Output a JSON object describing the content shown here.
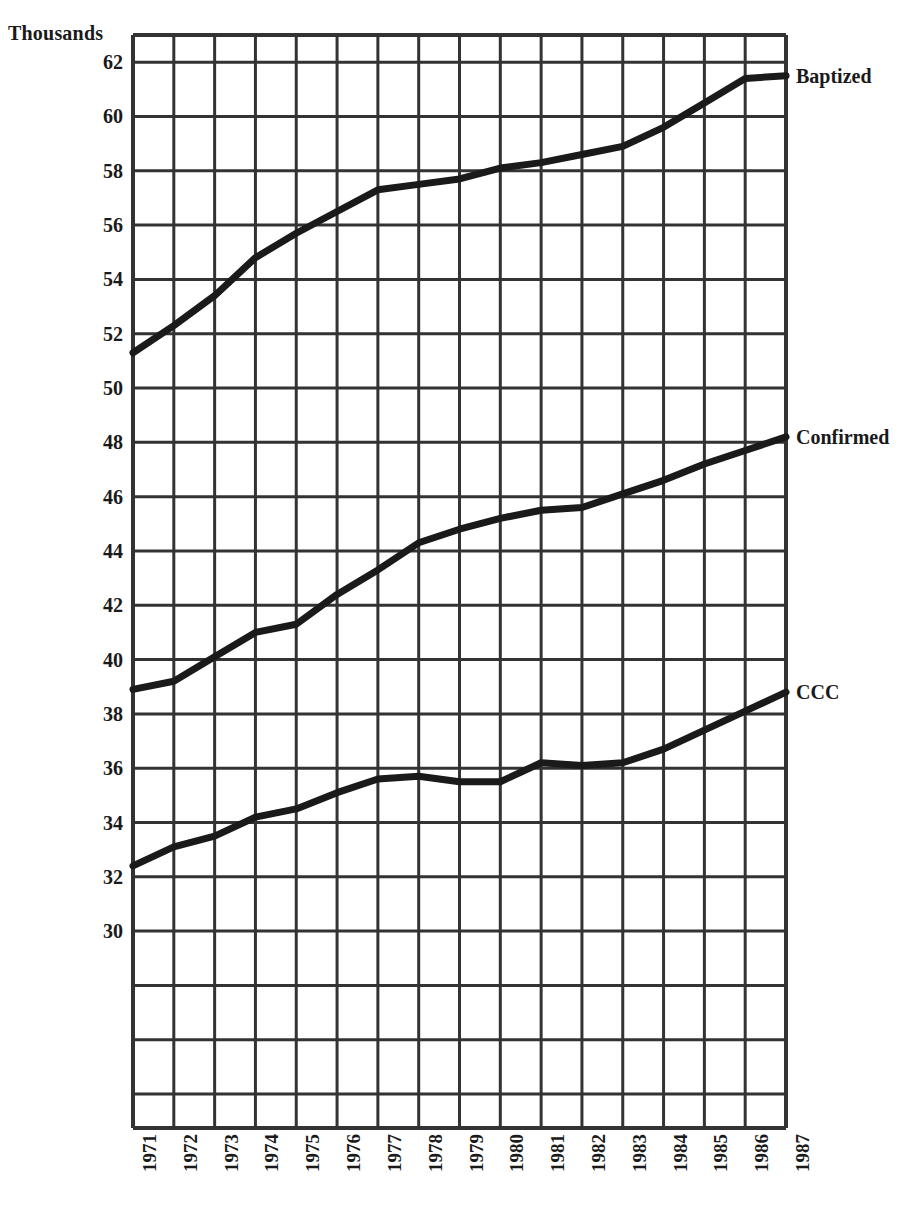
{
  "chart_data": {
    "type": "line",
    "title": "",
    "subtitle": "",
    "xlabel": "",
    "ylabel": "Thousands",
    "units_caption": "Thousands",
    "grid": true,
    "legend_position": "right-of-line-ends",
    "x": [
      1971,
      1972,
      1973,
      1974,
      1975,
      1976,
      1977,
      1978,
      1979,
      1980,
      1981,
      1982,
      1983,
      1984,
      1985,
      1986,
      1987
    ],
    "categories": [
      "1971",
      "1972",
      "1973",
      "1974",
      "1975",
      "1976",
      "1977",
      "1978",
      "1979",
      "1980",
      "1981",
      "1982",
      "1983",
      "1984",
      "1985",
      "1986",
      "1987"
    ],
    "xlim": [
      1971,
      1987
    ],
    "ylim": [
      22.75,
      63.0
    ],
    "y_ticks": [
      62,
      60,
      58,
      56,
      54,
      52,
      50,
      48,
      46,
      44,
      42,
      40,
      38,
      36,
      34,
      32,
      30
    ],
    "y_tick_labels": [
      "62",
      "60",
      "58",
      "56",
      "54",
      "52",
      "50",
      "48",
      "46",
      "44",
      "42",
      "40",
      "38",
      "36",
      "34",
      "32",
      "30"
    ],
    "y_tick_interval": 2,
    "line_color": "#1a1a1a",
    "grid_color": "#333333",
    "background_color": "#ffffff",
    "series": [
      {
        "name": "Baptized",
        "label": "Baptized",
        "color": "#1a1a1a",
        "values": [
          51.3,
          52.3,
          53.4,
          54.8,
          55.7,
          56.5,
          57.3,
          57.5,
          57.7,
          58.1,
          58.3,
          58.6,
          58.9,
          59.6,
          60.5,
          61.4,
          61.5
        ]
      },
      {
        "name": "Confirmed",
        "label": "Confirmed",
        "color": "#1a1a1a",
        "values": [
          38.9,
          39.2,
          40.1,
          41.0,
          41.3,
          42.4,
          43.3,
          44.3,
          44.8,
          45.2,
          45.5,
          45.6,
          46.1,
          46.6,
          47.2,
          47.7,
          48.2
        ]
      },
      {
        "name": "CCC",
        "label": "CCC",
        "color": "#1a1a1a",
        "values": [
          32.4,
          33.1,
          33.5,
          34.2,
          34.5,
          35.1,
          35.6,
          35.7,
          35.5,
          35.5,
          36.2,
          36.1,
          36.2,
          36.7,
          37.4,
          38.1,
          38.8
        ]
      }
    ]
  },
  "axes": {
    "units_caption": "Thousands"
  }
}
